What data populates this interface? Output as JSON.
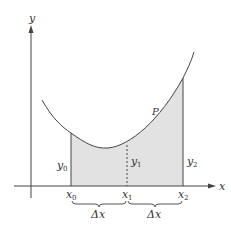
{
  "diagram": {
    "axes": {
      "x_label": "x",
      "y_label": "y"
    },
    "curve_label": "P",
    "points": [
      {
        "name": "x",
        "sub": "0"
      },
      {
        "name": "x",
        "sub": "1"
      },
      {
        "name": "x",
        "sub": "2"
      }
    ],
    "ordinates": [
      {
        "name": "y",
        "sub": "0"
      },
      {
        "name": "y",
        "sub": "1"
      },
      {
        "name": "y",
        "sub": "2"
      }
    ],
    "intervals": [
      {
        "label": "Δx"
      },
      {
        "label": "Δx"
      }
    ],
    "colors": {
      "line": "#444444",
      "fill": "#e2e2e2",
      "text": "#333333"
    }
  }
}
